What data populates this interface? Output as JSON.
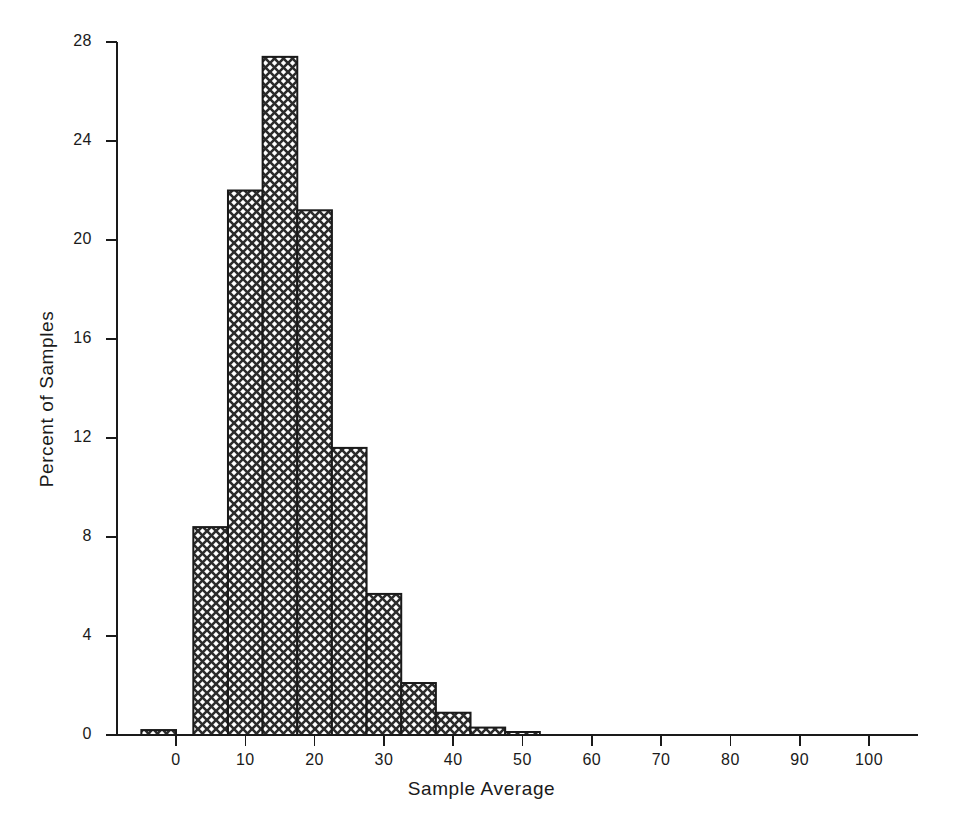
{
  "chart_data": {
    "type": "bar",
    "title": "",
    "subtitle": "",
    "xlabel": "Sample Average",
    "ylabel": "Percent of Samples",
    "xlim": [
      -7.5,
      107
    ],
    "ylim": [
      0,
      28
    ],
    "grid": false,
    "legend": null,
    "bin_width": 5,
    "xticks": [
      0,
      10,
      20,
      30,
      40,
      50,
      60,
      70,
      80,
      90,
      100
    ],
    "xtick_labels": [
      "0",
      "10",
      "20",
      "30",
      "40",
      "50",
      "60",
      "70",
      "80",
      "90",
      "100"
    ],
    "yticks": [
      0,
      4,
      8,
      12,
      16,
      20,
      24,
      28
    ],
    "ytick_labels": [
      "0",
      "4",
      "8",
      "12",
      "16",
      "20",
      "24",
      "28"
    ],
    "bar_style": {
      "fill": "crosshatch",
      "edge_color": "#1a1a1a",
      "pattern_color": "#3a3a3a",
      "background_color": "#ffffff"
    },
    "bins": [
      {
        "x0": -5.0,
        "x1": 0.0,
        "center": -2.5,
        "value": 0.2
      },
      {
        "x0": 2.5,
        "x1": 7.5,
        "center": 5.0,
        "value": 8.4
      },
      {
        "x0": 7.5,
        "x1": 12.5,
        "center": 10.0,
        "value": 22.0
      },
      {
        "x0": 12.5,
        "x1": 17.5,
        "center": 15.0,
        "value": 27.4
      },
      {
        "x0": 17.5,
        "x1": 22.5,
        "center": 20.0,
        "value": 21.2
      },
      {
        "x0": 22.5,
        "x1": 27.5,
        "center": 25.0,
        "value": 11.6
      },
      {
        "x0": 27.5,
        "x1": 32.5,
        "center": 30.0,
        "value": 5.7
      },
      {
        "x0": 32.5,
        "x1": 37.5,
        "center": 35.0,
        "value": 2.1
      },
      {
        "x0": 37.5,
        "x1": 42.5,
        "center": 40.0,
        "value": 0.9
      },
      {
        "x0": 42.5,
        "x1": 47.5,
        "center": 45.0,
        "value": 0.3
      },
      {
        "x0": 47.5,
        "x1": 52.5,
        "center": 50.0,
        "value": 0.12
      }
    ],
    "categories": [
      -2.5,
      5.0,
      10.0,
      15.0,
      20.0,
      25.0,
      30.0,
      35.0,
      40.0,
      45.0,
      50.0
    ],
    "values": [
      0.2,
      8.4,
      22.0,
      27.4,
      21.2,
      11.6,
      5.7,
      2.1,
      0.9,
      0.3,
      0.12
    ]
  },
  "figure": {
    "background_color": "#ffffff",
    "axis_color": "#1a1a1a"
  }
}
